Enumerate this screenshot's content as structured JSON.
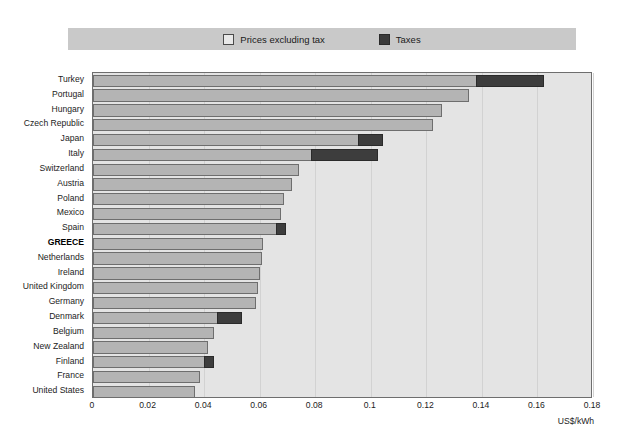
{
  "legend": {
    "items": [
      {
        "label": "Prices excluding tax",
        "color": "#e8e8e8",
        "key": "base"
      },
      {
        "label": "Taxes",
        "color": "#3d3d3d",
        "key": "tax"
      }
    ]
  },
  "axis": {
    "unit_label": "US$/kWh",
    "ticks": [
      "0",
      "0.02",
      "0.04",
      "0.06",
      "0.08",
      "0.1",
      "0.12",
      "0.14",
      "0.16",
      "0.18"
    ]
  },
  "highlight_category": "GREECE",
  "chart_data": {
    "type": "bar",
    "orientation": "horizontal",
    "stacked": true,
    "title": "",
    "xlabel": "US$/kWh",
    "ylabel": "",
    "xlim": [
      0,
      0.18
    ],
    "xticks": [
      0,
      0.02,
      0.04,
      0.06,
      0.08,
      0.1,
      0.12,
      0.14,
      0.16,
      0.18
    ],
    "grid": true,
    "legend_position": "top",
    "categories": [
      "Turkey",
      "Portugal",
      "Hungary",
      "Czech Republic",
      "Japan",
      "Italy",
      "Switzerland",
      "Austria",
      "Poland",
      "Mexico",
      "Spain",
      "GREECE",
      "Netherlands",
      "Ireland",
      "United Kingdom",
      "Germany",
      "Denmark",
      "Belgium",
      "New Zealand",
      "Finland",
      "France",
      "United States"
    ],
    "series": [
      {
        "name": "Prices excluding tax",
        "color": "#b4b4b4",
        "values": [
          0.138,
          0.1354,
          0.1256,
          0.1224,
          0.0954,
          0.0785,
          0.0742,
          0.0716,
          0.0688,
          0.0677,
          0.0659,
          0.0612,
          0.0608,
          0.0601,
          0.0594,
          0.0587,
          0.0446,
          0.0436,
          0.0414,
          0.04,
          0.0385,
          0.0367
        ]
      },
      {
        "name": "Taxes",
        "color": "#3d3d3d",
        "values": [
          0.0245,
          0,
          0,
          0,
          0.009,
          0.0241,
          0,
          0,
          0,
          0,
          0.0036,
          0,
          0,
          0,
          0,
          0,
          0.009,
          0,
          0,
          0.0036,
          0,
          0
        ]
      }
    ],
    "totals": [
      0.1625,
      0.1354,
      0.1256,
      0.1224,
      0.1044,
      0.1026,
      0.0742,
      0.0716,
      0.0688,
      0.0677,
      0.0695,
      0.0612,
      0.0608,
      0.0601,
      0.0594,
      0.0587,
      0.0536,
      0.0436,
      0.0414,
      0.0436,
      0.0385,
      0.0367
    ]
  }
}
